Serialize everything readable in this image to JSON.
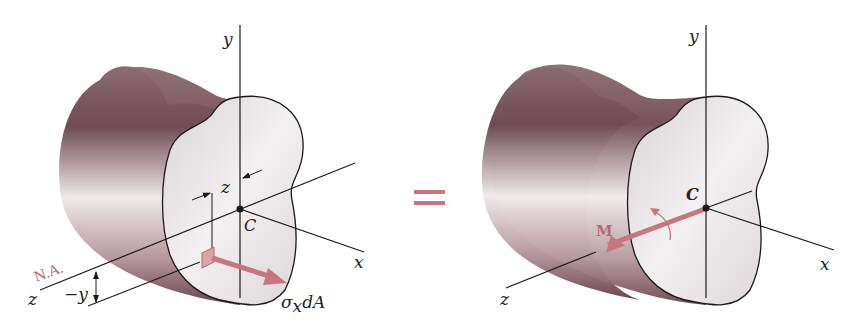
{
  "figure": {
    "left_panel": {
      "labels": {
        "y_axis": "y",
        "x_axis": "x",
        "z_axis": "z",
        "centroid": "C",
        "z_dim": "z",
        "neg_y_dim": "−y",
        "neutral_axis": "N.A.",
        "force_sigma": "σ",
        "force_sub": "x",
        "force_tail": "dA"
      }
    },
    "equals_sign": "=",
    "right_panel": {
      "labels": {
        "y_axis": "y",
        "x_axis": "x",
        "z_axis": "z",
        "centroid": "C",
        "moment": "M"
      }
    },
    "colors": {
      "accent": "#c7767f",
      "line": "#1a1a1a",
      "body_dark": "#6e4a52",
      "body_light": "#f2eeef",
      "face": "#e9e5e6"
    }
  }
}
